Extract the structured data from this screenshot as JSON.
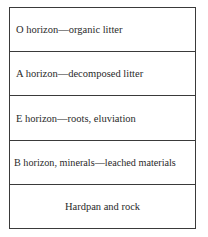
{
  "diagram": {
    "type": "soil-profile",
    "layers": [
      {
        "label": "O horizon—organic litter"
      },
      {
        "label": "A horizon—decomposed litter"
      },
      {
        "label": "E horizon—roots, eluviation"
      },
      {
        "label": "B horizon, minerals—leached materials"
      },
      {
        "label": "Hardpan and rock"
      }
    ]
  }
}
